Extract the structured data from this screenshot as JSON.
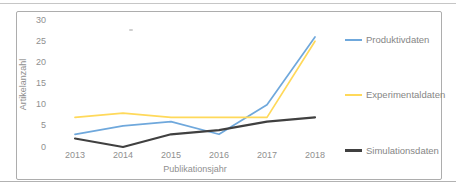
{
  "chart_data": {
    "type": "line",
    "categories": [
      "2013",
      "2014",
      "2015",
      "2016",
      "2017",
      "2018"
    ],
    "series": [
      {
        "name": "Produktivdaten",
        "color": "#6fa8dc",
        "values": [
          3,
          5,
          6,
          3,
          10,
          26
        ]
      },
      {
        "name": "Experimentaldaten",
        "color": "#ffd95a",
        "values": [
          7,
          8,
          7,
          7,
          7,
          25
        ]
      },
      {
        "name": "Simulationsdaten",
        "color": "#404040",
        "values": [
          2,
          0,
          3,
          4,
          6,
          7
        ]
      }
    ],
    "title": "",
    "xlabel": "Publikationsjahr",
    "ylabel": "Artikelanzahl",
    "ylim": [
      0,
      30
    ],
    "yticks": [
      0,
      5,
      10,
      15,
      20,
      25,
      30
    ],
    "grid": false,
    "legend_position": "right",
    "text_color": "#8f8f8f",
    "frame_color": "#adadad"
  }
}
